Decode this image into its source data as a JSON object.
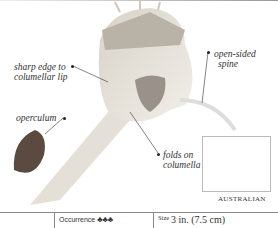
{
  "labels": {
    "sharp_edge": "sharp edge to columellar lip",
    "sharp_edge_l1": "sharp edge to",
    "sharp_edge_l2": "columellar lip",
    "open_spine_l1": "open-sided",
    "open_spine_l2": "spine",
    "operculum": "operculum",
    "folds_l1": "folds on",
    "folds_l2": "columella"
  },
  "map": {
    "caption": "AUSTRALIAN",
    "icon": "map-australia-icon"
  },
  "footer": {
    "occurrence_label": "Occurrence",
    "occurrence_icons": 3,
    "occurrence_glyph": "♣♣♣",
    "size_label": "Size",
    "size_value": "3 in. (7.5 cm)"
  },
  "colors": {
    "text": "#333333",
    "rule": "#888888",
    "map_land": "#3a3a3a"
  }
}
